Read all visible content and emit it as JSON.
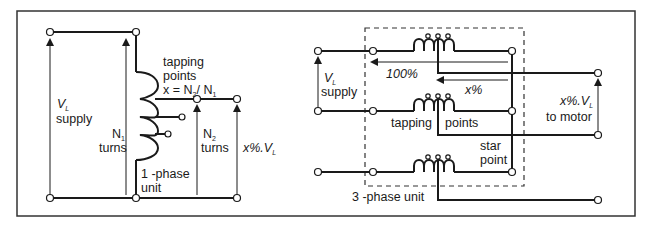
{
  "figure": {
    "colors": {
      "line": "#1a1a1a",
      "frame": "#333333",
      "background": "#ffffff"
    },
    "single_phase": {
      "supply_label": "V",
      "supply_label_sub": "L",
      "supply_word": "supply",
      "n1_label": "N",
      "n1_sub": "1",
      "n1_word": "turns",
      "tapping_line1": "tapping",
      "tapping_line2": "points",
      "formula_prefix": "x = N",
      "formula_sub1": "2",
      "formula_mid": "/ N",
      "formula_sub2": "1",
      "n2_label": "N",
      "n2_sub": "2",
      "n2_word": "turns",
      "output_label": "x%.V",
      "output_sub": "L",
      "unit_line1": "1 -phase",
      "unit_line2": "unit"
    },
    "three_phase": {
      "supply_label": "V",
      "supply_label_sub": "L",
      "supply_word": "supply",
      "arrow_100": "100%",
      "arrow_x": "x%",
      "tapping_word1": "tapping",
      "tapping_word2": "points",
      "star_line1": "star",
      "star_line2": "point",
      "output_label": "x%.V",
      "output_sub": "L",
      "output_word": "to motor",
      "unit_label": "3 -phase unit"
    }
  }
}
